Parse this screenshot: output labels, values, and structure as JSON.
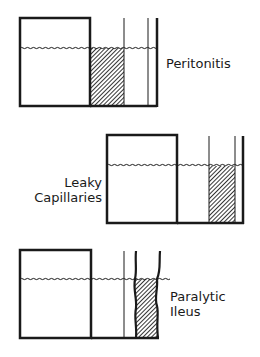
{
  "panels": [
    {
      "id": "peritonitis",
      "label_lines": [
        "Peritonitis"
      ]
    },
    {
      "id": "leaky-capillaries",
      "label_lines": [
        "Leaky",
        "Capillaries"
      ]
    },
    {
      "id": "paralytic-ileus",
      "label_lines": [
        "Paralytic",
        "Ileus"
      ]
    }
  ],
  "colors": {
    "line": "#1a1a1a",
    "hatch": "#2a2a2a",
    "background": "#ffffff"
  }
}
